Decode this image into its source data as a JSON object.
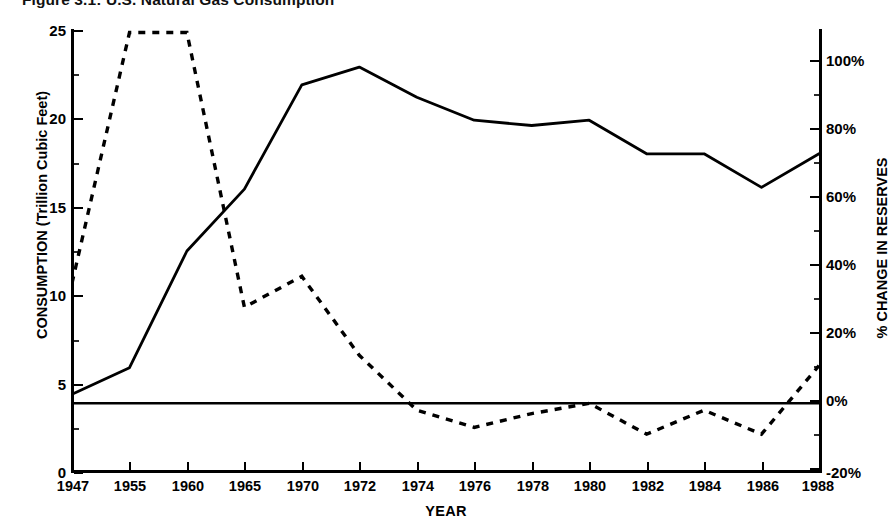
{
  "title": "Figure 3.1:  U.S. Natural Gas Consumption",
  "axes": {
    "x_title": "YEAR",
    "y_left_title": "CONSUMPTION (Trillion Cubic Feet)",
    "y_right_title": "% CHANGE IN RESERVES"
  },
  "chart_data": {
    "type": "line",
    "title": "Figure 3.1:  U.S. Natural Gas Consumption",
    "xlabel": "YEAR",
    "ylabel": "CONSUMPTION (Trillion Cubic Feet)",
    "y2label": "% CHANGE IN RESERVES",
    "grid": false,
    "legend_position": "none",
    "categories": [
      "1947",
      "1955",
      "1960",
      "1965",
      "1970",
      "1972",
      "1974",
      "1976",
      "1978",
      "1980",
      "1982",
      "1984",
      "1986",
      "1988"
    ],
    "x_tick_labels": [
      "1947",
      "1955",
      "1960",
      "1965",
      "1970",
      "1972",
      "1974",
      "1976",
      "1978",
      "1980",
      "1982",
      "1984",
      "1986",
      "1988"
    ],
    "y_tick_labels": [
      "0",
      "5",
      "10",
      "15",
      "20",
      "25"
    ],
    "y_tick_values": [
      0,
      5,
      10,
      15,
      20,
      25
    ],
    "y_minor_tick_values": [
      2.5,
      7.5,
      12.5,
      17.5,
      22.5
    ],
    "ylim": [
      0,
      25
    ],
    "y2_tick_labels": [
      "-20%",
      "0%",
      "20%",
      "40%",
      "60%",
      "80%",
      "100%"
    ],
    "y2_tick_values": [
      -20,
      0,
      20,
      40,
      60,
      80,
      100
    ],
    "y2_minor_tick_values": [
      -10,
      10,
      30,
      50,
      70,
      90
    ],
    "y2lim": [
      -20,
      110
    ],
    "reference_line": {
      "axis": "y2",
      "value": 0,
      "style": "solid",
      "label": "0%"
    },
    "series": [
      {
        "name": "Consumption",
        "axis": "left",
        "style": "solid",
        "unit": "Trillion Cubic Feet",
        "values": [
          4.4,
          5.9,
          12.5,
          16.0,
          21.9,
          22.9,
          21.2,
          19.9,
          19.6,
          19.9,
          18.0,
          18.0,
          16.1,
          18.0
        ]
      },
      {
        "name": "Change in Reserves",
        "axis": "right",
        "style": "dashed",
        "unit": "%",
        "values": [
          35,
          108,
          108,
          28,
          37,
          14,
          -2,
          -7,
          -3,
          0,
          -9,
          -2,
          -9,
          11
        ]
      }
    ]
  }
}
